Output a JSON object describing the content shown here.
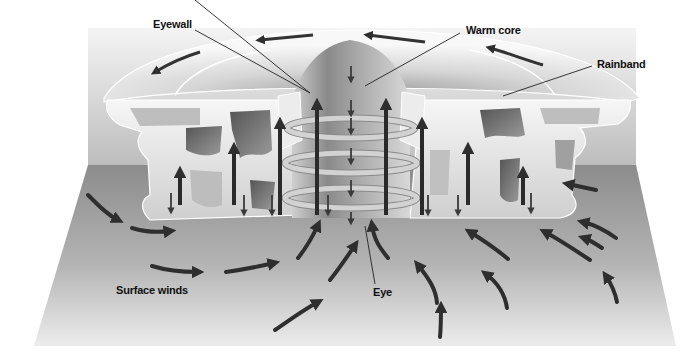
{
  "diagram": {
    "labels": {
      "eyewall": "Eyewall",
      "warm_core": "Warm core",
      "rainband": "Rainband",
      "surface_winds": "Surface winds",
      "eye": "Eye"
    },
    "colors": {
      "background": "#ffffff",
      "wall_top": "#f2f2f2",
      "wall_bottom": "#b8b8b8",
      "floor_back": "#8a8a8a",
      "floor_front": "#e6e6e6",
      "cloud": "#e4e4e4",
      "cloud_shadow": "#6a6a6a",
      "arrow": "#2e2e2e",
      "ring": "#c8c8c8",
      "leader_line": "#222222"
    }
  }
}
